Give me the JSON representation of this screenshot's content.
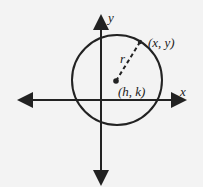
{
  "diagram": {
    "axes": {
      "x_label": "x",
      "y_label": "y"
    },
    "center_label": "(h, k)",
    "point_label": "(x, y)",
    "radius_label": "r",
    "colors": {
      "background": "#f3f3f3",
      "stroke": "#222222"
    }
  }
}
